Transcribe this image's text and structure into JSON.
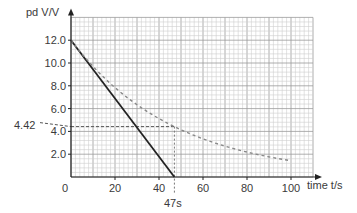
{
  "chart_data": {
    "type": "line",
    "title": "",
    "xlabel": "time t/s",
    "ylabel": "pd V/V",
    "xlim": [
      0,
      110
    ],
    "ylim": [
      0,
      14
    ],
    "grid": true,
    "x_ticks": [
      0,
      20,
      40,
      60,
      80,
      100
    ],
    "x_tick_labels": [
      "0",
      "20",
      "40",
      "60",
      "80",
      "100"
    ],
    "y_ticks": [
      2.0,
      4.0,
      6.0,
      8.0,
      10.0,
      12.0
    ],
    "y_tick_labels": [
      "2.0",
      "4.0",
      "6.0",
      "8.0",
      "10.0",
      "12.0"
    ],
    "series": [
      {
        "name": "constant-rate discharge",
        "style": "solid",
        "color": "#222222",
        "x": [
          0,
          47
        ],
        "y": [
          12.0,
          0.0
        ]
      },
      {
        "name": "exponential discharge",
        "style": "dashed",
        "color": "#888888",
        "x": [
          0,
          10,
          20,
          30,
          40,
          47,
          50,
          60,
          70,
          80,
          90,
          100
        ],
        "y": [
          12.0,
          9.71,
          7.85,
          6.35,
          5.14,
          4.42,
          4.16,
          3.36,
          2.72,
          2.2,
          1.78,
          1.43
        ]
      }
    ],
    "annotations": [
      {
        "text": "4.42",
        "type": "y-marker",
        "value": 4.42
      },
      {
        "text": "47s",
        "type": "x-marker",
        "value": 47
      }
    ]
  },
  "labels": {
    "y_axis": "pd V/V",
    "x_axis": "time t/s",
    "origin": "0",
    "marker_y": "4.42",
    "marker_x": "47s"
  }
}
